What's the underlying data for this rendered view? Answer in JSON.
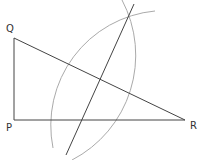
{
  "diagram": {
    "points": {
      "Q": {
        "label": "Q",
        "x": 14,
        "y": 38
      },
      "P": {
        "label": "P",
        "x": 14,
        "y": 120
      },
      "R": {
        "label": "R",
        "x": 185,
        "y": 120
      }
    },
    "segments": [
      {
        "from": "Q",
        "to": "P"
      },
      {
        "from": "P",
        "to": "R"
      },
      {
        "from": "Q",
        "to": "R"
      }
    ],
    "bisector": {
      "x1": 66,
      "y1": 155,
      "x2": 134,
      "y2": 4
    },
    "arcs": [
      {
        "center": "R",
        "radius": 118
      },
      {
        "center": "Q",
        "radius": 115
      }
    ],
    "colors": {
      "line": "#444444",
      "arc": "#aaaaaa",
      "text": "#333333"
    }
  }
}
